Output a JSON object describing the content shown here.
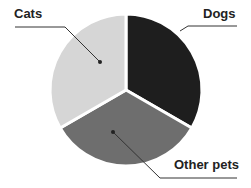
{
  "chart_data": {
    "type": "pie",
    "title": "",
    "categories": [
      "Dogs",
      "Other pets",
      "Cats"
    ],
    "values": [
      33.3,
      33.3,
      33.3
    ],
    "colors": [
      "#1e1e1e",
      "#6e6e6e",
      "#d6d6d6"
    ],
    "legend": "none (leader-line labels)"
  },
  "labels": {
    "cats": "Cats",
    "dogs": "Dogs",
    "other": "Other pets"
  }
}
